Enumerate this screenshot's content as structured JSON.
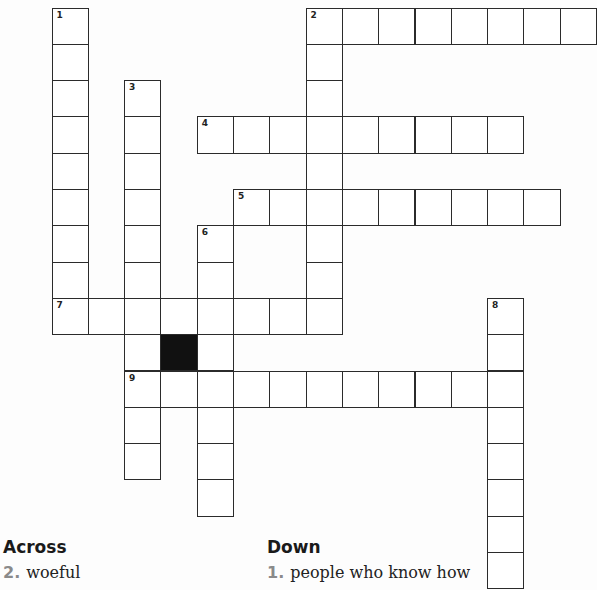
{
  "grid": {
    "origin_x": 52,
    "origin_y": 8,
    "cell_size": 36.3,
    "words": [
      {
        "number": 1,
        "direction": "down",
        "col": 0,
        "row": 0,
        "length": 9
      },
      {
        "number": 2,
        "direction": "across",
        "col": 7,
        "row": 0,
        "length": 8
      },
      {
        "number": 2,
        "direction": "down",
        "col": 7,
        "row": 0,
        "length": 9
      },
      {
        "number": 3,
        "direction": "down",
        "col": 2,
        "row": 2,
        "length": 11
      },
      {
        "number": 4,
        "direction": "across",
        "col": 4,
        "row": 3,
        "length": 9
      },
      {
        "number": 5,
        "direction": "across",
        "col": 5,
        "row": 5,
        "length": 9
      },
      {
        "number": 6,
        "direction": "down",
        "col": 4,
        "row": 6,
        "length": 8
      },
      {
        "number": 7,
        "direction": "across",
        "col": 0,
        "row": 8,
        "length": 8
      },
      {
        "number": 8,
        "direction": "down",
        "col": 12,
        "row": 8,
        "length": 8
      },
      {
        "number": 9,
        "direction": "across",
        "col": 2,
        "row": 10,
        "length": 11
      }
    ],
    "black_cells": [
      {
        "col": 3,
        "row": 9
      }
    ]
  },
  "clues": {
    "across_heading": "Across",
    "down_heading": "Down",
    "across": [
      {
        "number": "2.",
        "text": "woeful"
      }
    ],
    "down": [
      {
        "number": "1.",
        "text": "people who know how"
      }
    ]
  }
}
